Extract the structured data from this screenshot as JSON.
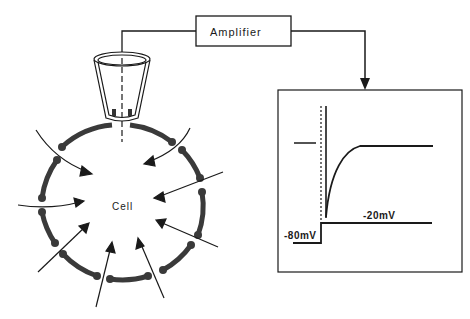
{
  "diagram": {
    "type": "patch-clamp schematic",
    "amplifier": {
      "label": "Amplifier"
    },
    "cell": {
      "label": "Cell"
    },
    "trace_panel": {
      "voltage_step": {
        "holding_label": "-80mV",
        "step_label": "-20mV"
      },
      "traces": [
        "voltage command step",
        "inward current transient decaying to steady level"
      ]
    },
    "colors": {
      "ink": "#1a1a1a",
      "membrane": "#3a3a3a",
      "background": "#ffffff"
    }
  }
}
